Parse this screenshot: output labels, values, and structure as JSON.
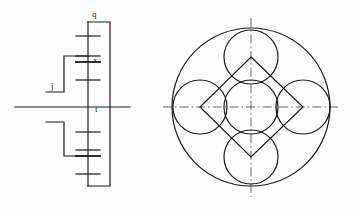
{
  "drawing": {
    "title": "Mechanical schematic and planetary circle layout",
    "background_color": "#fefefe",
    "line_color": "#1a1a1a",
    "centerline_color": "#555555",
    "labels": {
      "q": "q",
      "x": "x",
      "j": "j",
      "t": "t"
    },
    "left_view": {
      "name": "shaft-schematic",
      "shaft_axis_y": 107,
      "shaft_x": 88,
      "shaft_top_y": 22,
      "shaft_bottom_y": 186,
      "horizontal_axis": {
        "x1": 15,
        "x2": 130,
        "y": 107
      },
      "gear_plates": [
        {
          "id": "plate-1",
          "y": 36,
          "half_width": 12
        },
        {
          "id": "plate-2",
          "y": 56,
          "half_width": 12
        },
        {
          "id": "plate-3",
          "y": 62,
          "half_width": 12
        },
        {
          "id": "plate-4",
          "y": 80,
          "half_width": 12
        },
        {
          "id": "plate-5",
          "y": 132,
          "half_width": 12
        },
        {
          "id": "plate-6",
          "y": 150,
          "half_width": 12
        },
        {
          "id": "plate-7",
          "y": 156,
          "half_width": 12
        },
        {
          "id": "plate-8",
          "y": 174,
          "half_width": 12
        }
      ],
      "outer_bracket": {
        "x": 110,
        "top_y": 22,
        "bottom_y": 186
      },
      "upper_link": {
        "x": 64,
        "top_y": 56,
        "bottom_y": 92
      },
      "lower_link": {
        "x": 64,
        "top_y": 122,
        "bottom_y": 156
      },
      "input_stub": {
        "x1": 46,
        "x2": 64,
        "y": 92
      }
    },
    "right_view": {
      "name": "planetary-circle-layout",
      "center": {
        "x": 251,
        "y": 107
      },
      "outer_circle_radius": 79,
      "satellite_radius": 27,
      "center_circle_radius": 27,
      "satellites": [
        {
          "id": "satellite-north",
          "cx": 251,
          "cy": 57
        },
        {
          "id": "satellite-east",
          "cx": 303,
          "cy": 107
        },
        {
          "id": "satellite-south",
          "cx": 251,
          "cy": 157
        },
        {
          "id": "satellite-west",
          "cx": 200,
          "cy": 107
        }
      ],
      "diamond_vertices": "251,57 303,107 251,157 200,107",
      "centerline_horizontal": {
        "x1": 163,
        "x2": 341,
        "y": 107
      },
      "centerline_vertical": {
        "x": 251,
        "y1": 18,
        "y2": 197
      }
    }
  }
}
